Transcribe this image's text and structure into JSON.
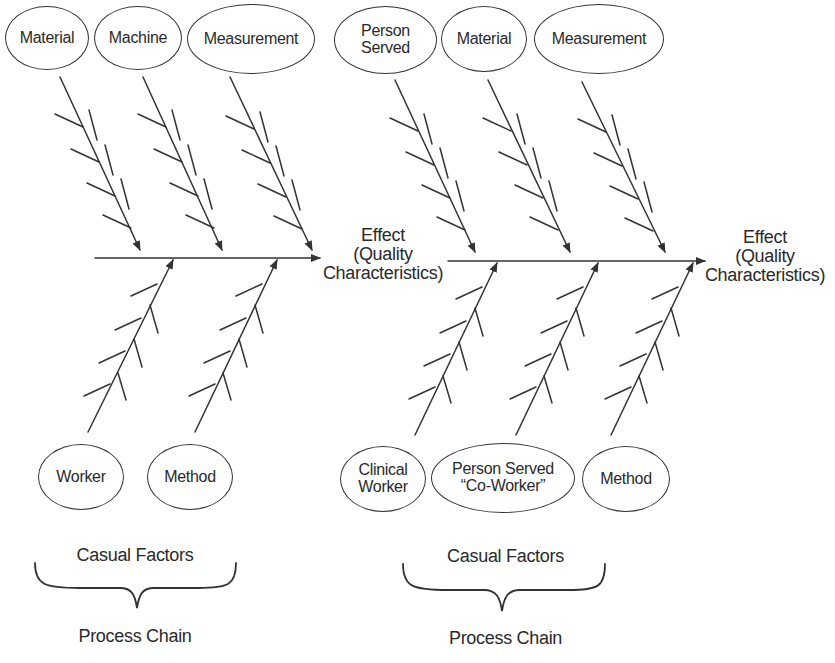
{
  "diagrams": [
    {
      "name": "left-fishbone",
      "top_causes": [
        "Material",
        "Machine",
        "Measurement"
      ],
      "bottom_causes": [
        "Worker",
        "Method"
      ],
      "effect": {
        "line1": "Effect",
        "line2": "(Quality",
        "line3": "Characteristics)"
      },
      "brace_label": "Casual Factors",
      "footer": "Process Chain"
    },
    {
      "name": "right-fishbone",
      "top_causes": [
        {
          "line1": "Person",
          "line2": "Served"
        },
        "Material",
        "Measurement"
      ],
      "bottom_causes": [
        {
          "line1": "Clinical",
          "line2": "Worker"
        },
        {
          "line1": "Person Served",
          "line2": "“Co-Worker”"
        },
        "Method"
      ],
      "effect": {
        "line1": "Effect",
        "line2": "(Quality",
        "line3": "Characteristics)"
      },
      "brace_label": "Casual Factors",
      "footer": "Process Chain"
    }
  ],
  "colors": {
    "stroke": "#333333",
    "text": "#2a2a2a",
    "background": "#ffffff"
  }
}
